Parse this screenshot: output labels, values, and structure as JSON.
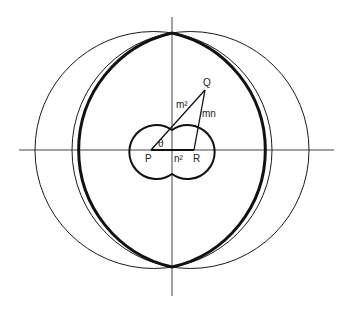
{
  "diagram": {
    "labels": {
      "P": "P",
      "R": "R",
      "Q": "Q",
      "theta": "θ",
      "m2": "m²",
      "mn": "mn",
      "n2": "n²"
    },
    "colors": {
      "stroke": "#1a1a1a",
      "axis": "#444444",
      "background": "#ffffff"
    },
    "geometry": {
      "origin": [
        172,
        150
      ],
      "horizontal_axis": [
        19,
        334
      ],
      "vertical_axis": [
        17,
        296
      ],
      "outer_thin_circles": [
        {
          "cx": 153.5,
          "cy": 150,
          "r": 118.5
        },
        {
          "cx": 190.5,
          "cy": 150,
          "r": 118.5
        }
      ],
      "thick_lens_arcs": [
        {
          "cx": 199,
          "cy": 150,
          "r": 120
        },
        {
          "cx": 145,
          "cy": 150,
          "r": 120
        }
      ],
      "small_circles": [
        {
          "cx": 147,
          "cy": 152,
          "r": 27
        },
        {
          "cx": 197,
          "cy": 152,
          "r": 27
        }
      ],
      "points": {
        "P": [
          151,
          150
        ],
        "R": [
          194,
          150
        ],
        "Q": [
          205,
          90
        ]
      }
    }
  }
}
